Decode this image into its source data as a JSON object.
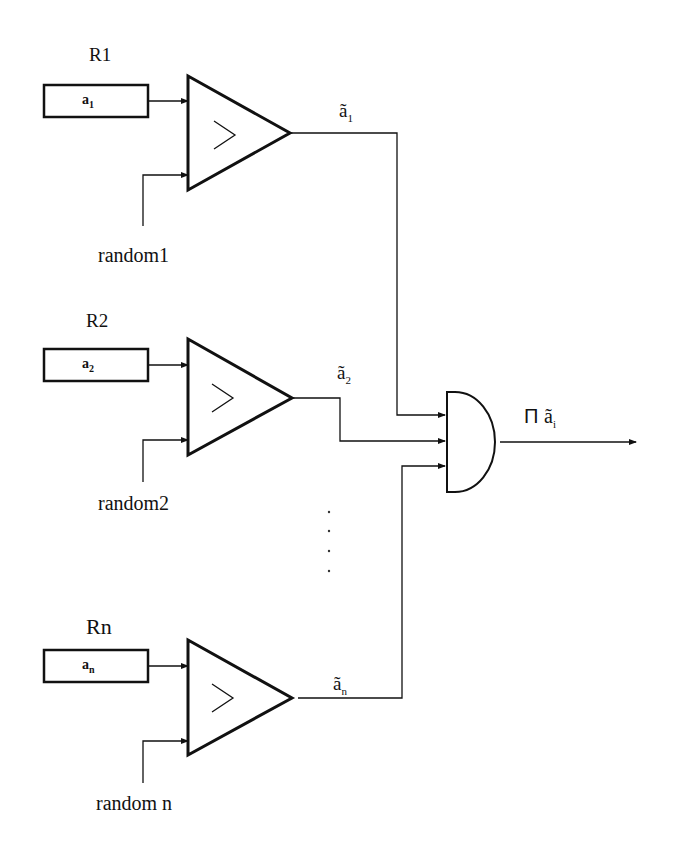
{
  "diagram": {
    "branches": [
      {
        "register_name": "R1",
        "register_value": "a",
        "register_sub": "1",
        "random_label": "random1",
        "output_label": "ã",
        "output_sub": "1"
      },
      {
        "register_name": "R2",
        "register_value": "a",
        "register_sub": "2",
        "random_label": "random2",
        "output_label": "ã",
        "output_sub": "2"
      },
      {
        "register_name": "Rn",
        "register_value": "a",
        "register_sub": "n",
        "random_label": "random n",
        "output_label": "ã",
        "output_sub": "n"
      }
    ],
    "comparator_symbol": ">",
    "and_gate_output": {
      "product_symbol": "Π",
      "label": "ã",
      "sub": "i"
    },
    "ellipsis": "· · · ·",
    "colors": {
      "line": "#111111",
      "background": "#ffffff"
    }
  }
}
